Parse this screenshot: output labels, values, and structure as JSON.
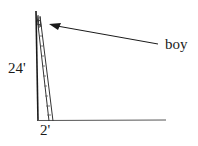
{
  "diagram": {
    "type": "ladder-against-wall",
    "labels": {
      "boy": "boy",
      "height": "24'",
      "base": "2'"
    },
    "colors": {
      "line": "#1a1a1a",
      "background": "#ffffff"
    }
  }
}
